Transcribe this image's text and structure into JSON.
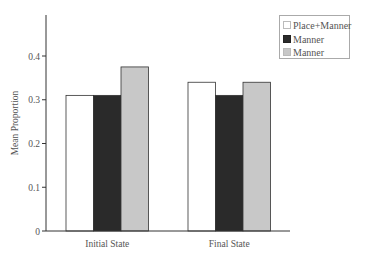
{
  "chart_data": {
    "type": "bar",
    "title": "",
    "xlabel": "",
    "ylabel": "Mean Proportion",
    "ylim": [
      0,
      0.5
    ],
    "yticks": [
      0,
      0.1,
      0.2,
      0.3,
      0.4
    ],
    "ytick_labels": [
      "0",
      "0.1",
      "0.2",
      "0.3",
      "0.4"
    ],
    "grid": false,
    "legend_position": "top-right",
    "categories": [
      "Initial State",
      "Final State"
    ],
    "series": [
      {
        "name": "Place+Manner",
        "color": "#ffffff",
        "values": [
          0.31,
          0.34
        ]
      },
      {
        "name": "Manner",
        "color": "#2a2a2a",
        "values": [
          0.31,
          0.31
        ]
      },
      {
        "name": "Manner",
        "color": "#c8c8c8",
        "values": [
          0.375,
          0.34
        ]
      }
    ]
  },
  "legend": {
    "items": [
      {
        "label": "Place+Manner",
        "color": "#ffffff"
      },
      {
        "label": "Manner",
        "color": "#2a2a2a"
      },
      {
        "label": "Manner",
        "color": "#c8c8c8"
      }
    ]
  }
}
